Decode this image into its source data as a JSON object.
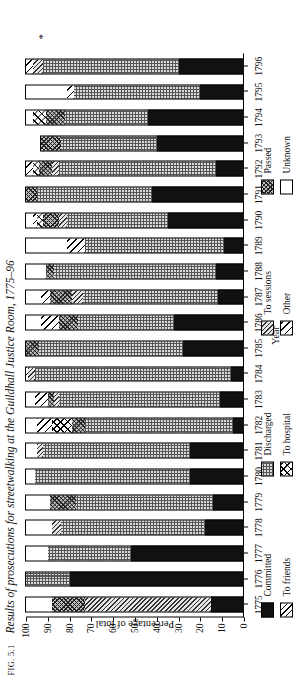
{
  "figure": {
    "fig_label": "FIG. 5.1",
    "title": "Results of prosecutions for streetwalking at the Guildhall Justice Room, 1775–96",
    "asterisk": "*"
  },
  "axes": {
    "y_title": "Percentage of total",
    "y_ticks": [
      "0",
      "10",
      "20",
      "30",
      "40",
      "50",
      "60",
      "70",
      "80",
      "90",
      "100"
    ],
    "x_title": "Year"
  },
  "legend": {
    "columns": [
      {
        "entries": [
          {
            "label": "Committed",
            "pattern": "committed"
          },
          {
            "label": "To friends",
            "pattern": "tofriends"
          }
        ]
      },
      {
        "entries": [
          {
            "label": "Discharged",
            "pattern": "discharged"
          },
          {
            "label": "To hospital",
            "pattern": "tohospital"
          }
        ]
      },
      {
        "entries": [
          {
            "label": "To sessions",
            "pattern": "tosessions"
          },
          {
            "label": "Other",
            "pattern": "other"
          }
        ]
      },
      {
        "entries": [
          {
            "label": "Passed",
            "pattern": "passed"
          },
          {
            "label": "Unknown",
            "pattern": "unknown"
          }
        ]
      }
    ]
  },
  "chart_data": {
    "type": "bar",
    "subtype": "stacked-horizontal-percentage",
    "title": "Results of prosecutions for streetwalking at the Guildhall Justice Room, 1775–96",
    "xlabel": "Year",
    "ylabel": "Percentage of total",
    "ylim": [
      0,
      100
    ],
    "grid": false,
    "legend_position": "bottom",
    "orientation": "bars drawn horizontally (figure rotated 90° on page)",
    "categories": [
      "1775",
      "1776",
      "1777",
      "1778",
      "1779",
      "1780",
      "1781",
      "1782",
      "1783",
      "1784",
      "1785",
      "1786",
      "1787",
      "1788",
      "1789",
      "1790",
      "1791",
      "1792",
      "1793",
      "1794",
      "1795",
      "1796"
    ],
    "series": [
      {
        "name": "Committed",
        "pattern": "committed",
        "values": [
          15,
          80,
          52,
          18,
          14,
          25,
          25,
          5,
          11,
          6,
          28,
          32,
          12,
          13,
          9,
          35,
          42,
          13,
          40,
          44,
          20,
          30
        ]
      },
      {
        "name": "Discharged",
        "pattern": "discharged",
        "values": [
          0,
          20,
          38,
          66,
          63,
          71,
          67,
          68,
          74,
          90,
          66,
          44,
          62,
          74,
          64,
          46,
          53,
          72,
          44,
          38,
          58,
          62
        ]
      },
      {
        "name": "To sessions",
        "pattern": "tosessions",
        "values": [
          58,
          0,
          0,
          4,
          0,
          0,
          3,
          0,
          2,
          3,
          0,
          0,
          5,
          0,
          0,
          4,
          0,
          3,
          0,
          0,
          0,
          5
        ]
      },
      {
        "name": "Passed",
        "pattern": "passed",
        "values": [
          15,
          0,
          0,
          0,
          12,
          0,
          0,
          6,
          3,
          0,
          6,
          9,
          10,
          4,
          0,
          7,
          5,
          6,
          9,
          9,
          0,
          0
        ]
      },
      {
        "name": "To hospital",
        "pattern": "tohospital",
        "values": [
          0,
          0,
          0,
          0,
          0,
          0,
          0,
          9,
          0,
          0,
          0,
          0,
          0,
          0,
          0,
          3,
          0,
          3,
          0,
          6,
          0,
          0
        ]
      },
      {
        "name": "Other",
        "pattern": "other",
        "values": [
          0,
          0,
          0,
          0,
          0,
          0,
          0,
          7,
          6,
          1,
          0,
          8,
          4,
          0,
          8,
          2,
          0,
          3,
          0,
          0,
          3,
          3
        ]
      },
      {
        "name": "To friends",
        "pattern": "tofriends",
        "values": [
          0,
          0,
          0,
          0,
          0,
          0,
          0,
          0,
          0,
          0,
          0,
          0,
          0,
          0,
          0,
          0,
          0,
          0,
          0,
          0,
          0,
          0
        ]
      },
      {
        "name": "Unknown",
        "pattern": "unknown",
        "values": [
          12,
          0,
          10,
          12,
          11,
          4,
          5,
          5,
          4,
          0,
          0,
          7,
          7,
          9,
          19,
          3,
          0,
          0,
          0,
          3,
          19,
          0
        ]
      }
    ]
  }
}
